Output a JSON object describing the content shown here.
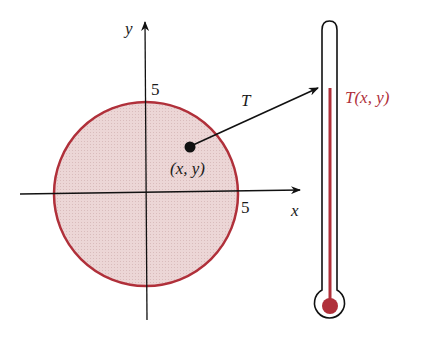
{
  "diagram": {
    "axes": {
      "x_label": "x",
      "y_label": "y",
      "x_tick": "5",
      "y_tick": "5"
    },
    "region": {
      "shape": "disk",
      "radius": 5,
      "fill": "#ecd6d6",
      "stroke": "#b0303a"
    },
    "point_label": "(x, y)",
    "mapping_label": "T",
    "thermometer_label": "T(x, y)",
    "colors": {
      "accent": "#b0303a",
      "ink": "#111111"
    }
  }
}
